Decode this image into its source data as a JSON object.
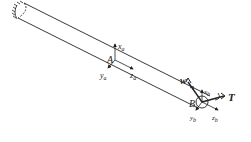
{
  "diagram": {
    "colors": {
      "stroke": "#222222",
      "background": "#ffffff"
    },
    "points": {
      "A": {
        "label": "A"
      },
      "B": {
        "label": "B"
      }
    },
    "frame_a": {
      "x": {
        "base": "x",
        "sub": "a"
      },
      "y": {
        "base": "y",
        "sub": "a"
      },
      "z": {
        "base": "z",
        "sub": "a"
      }
    },
    "frame_b": {
      "x": {
        "base": "x",
        "sub": "b"
      },
      "y": {
        "base": "y",
        "sub": "b"
      },
      "z": {
        "base": "z",
        "sub": "b"
      }
    },
    "loads": {
      "w": {
        "label": "w"
      },
      "T": {
        "label": "T"
      }
    },
    "support": {
      "type": "fixed-wall-hatching"
    }
  }
}
